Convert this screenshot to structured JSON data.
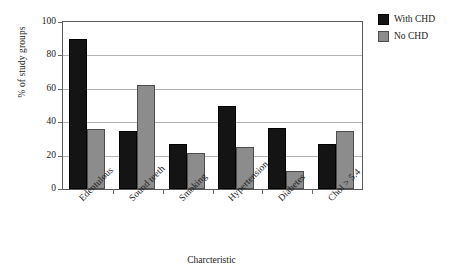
{
  "chart_data": {
    "type": "bar",
    "title": "",
    "xlabel": "Charcteristic",
    "ylabel": "% of study groups",
    "categories": [
      "Edentulous",
      "Sound teeth",
      "Smoking",
      "Hypertension",
      "Diabetes",
      "Chol > 5.4"
    ],
    "series": [
      {
        "name": "With CHD",
        "color": "#141414",
        "values": [
          90,
          35,
          27,
          50,
          36.5,
          27
        ]
      },
      {
        "name": "No CHD",
        "color": "#8c8c8c",
        "values": [
          36,
          62,
          21.5,
          25,
          11,
          35
        ]
      }
    ],
    "ylim": [
      0,
      100
    ],
    "yticks": [
      0,
      20,
      40,
      60,
      80,
      100
    ],
    "ytick_labels": [
      "0",
      "20",
      "40",
      "60",
      "80",
      "100"
    ],
    "grid": "horizontal",
    "legend_position": "top-right",
    "annotations": []
  },
  "legend": {
    "entries": [
      {
        "label": "With CHD",
        "swatch": "black-square-swatch"
      },
      {
        "label": "No CHD",
        "swatch": "gray-square-swatch"
      }
    ]
  }
}
